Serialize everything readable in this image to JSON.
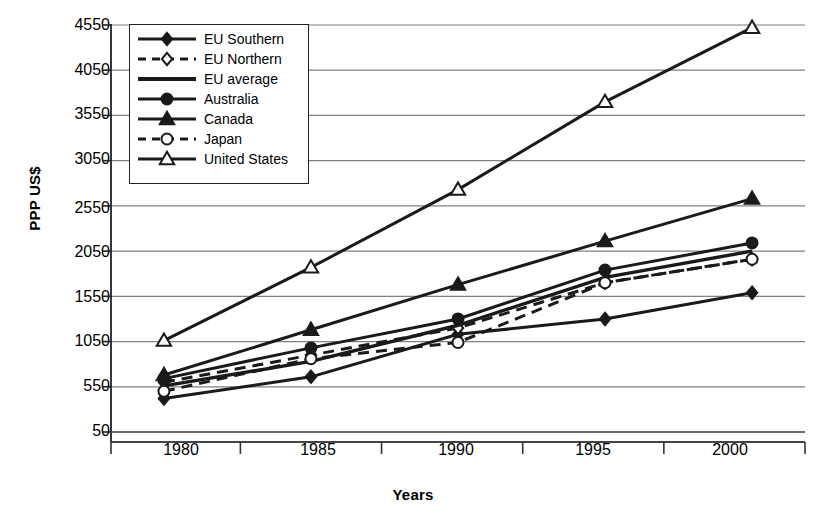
{
  "chart_data": {
    "type": "line",
    "title": "",
    "xlabel": "Years",
    "ylabel": "PPP US$",
    "x": [
      1980,
      1985,
      1990,
      1995,
      2000
    ],
    "categories": [
      "1980",
      "1985",
      "1990",
      "1995",
      "2000"
    ],
    "xtick_labels": [
      "1980",
      "1985",
      "1990",
      "1995",
      "2000"
    ],
    "ytick_labels": [
      "4550",
      "4050",
      "3550",
      "3050",
      "2550",
      "2050",
      "1550",
      "1050",
      "550",
      "50"
    ],
    "ytick_values": [
      4550,
      4050,
      3550,
      3050,
      2550,
      2050,
      1550,
      1050,
      550,
      50
    ],
    "ylim": [
      50,
      4550
    ],
    "xlim": [
      1978.2,
      2001.8
    ],
    "grid": "horizontal",
    "legend_position": "top-left-inside",
    "series": [
      {
        "name": "EU Southern",
        "marker": "filled-diamond",
        "line": "solid",
        "values": [
          420,
          660,
          1130,
          1300,
          1590
        ]
      },
      {
        "name": "EU Northern",
        "marker": "open-diamond",
        "line": "dashed",
        "values": [
          600,
          900,
          1200,
          1700,
          1960
        ]
      },
      {
        "name": "EU average",
        "marker": "none",
        "line": "solid",
        "values": [
          560,
          830,
          1230,
          1760,
          2050
        ]
      },
      {
        "name": "Australia",
        "marker": "filled-circle",
        "line": "solid",
        "values": [
          640,
          980,
          1300,
          1840,
          2140
        ]
      },
      {
        "name": "Canada",
        "marker": "filled-triangle",
        "line": "solid",
        "values": [
          680,
          1180,
          1680,
          2160,
          2630
        ]
      },
      {
        "name": "Japan",
        "marker": "open-circle",
        "line": "dashed",
        "values": [
          500,
          860,
          1040,
          1700,
          1960
        ]
      },
      {
        "name": "United States",
        "marker": "open-triangle",
        "line": "solid",
        "values": [
          1060,
          1870,
          2730,
          3700,
          4520
        ]
      }
    ]
  },
  "colors": {
    "line": "#1a1a1a",
    "grid": "#808080",
    "axis": "#333333",
    "background": "#ffffff"
  }
}
